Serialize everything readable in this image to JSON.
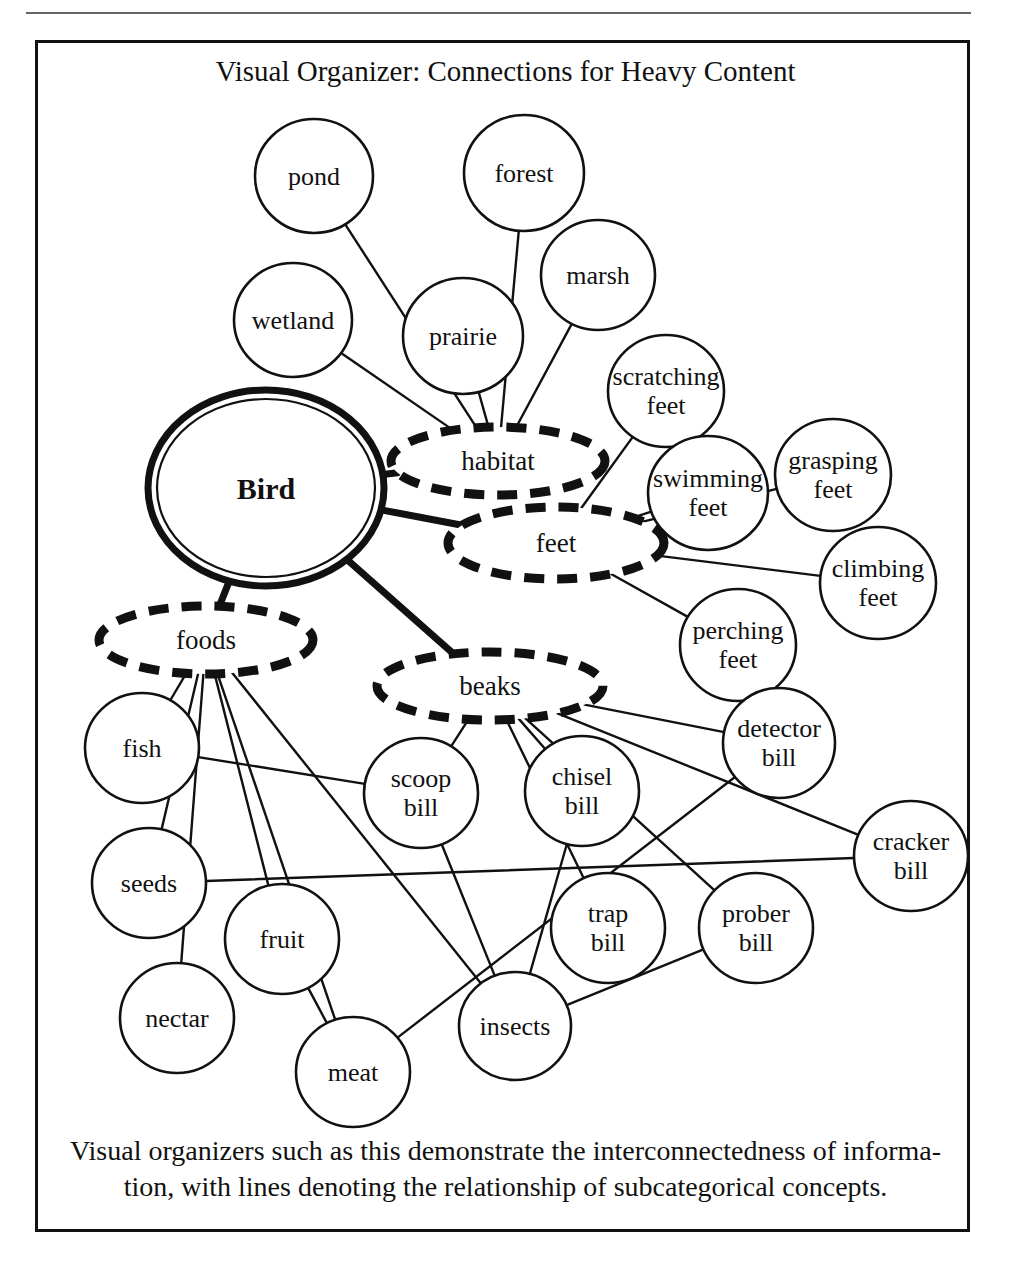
{
  "page": {
    "title": "Visual Organizer: Connections for Heavy Content",
    "caption_line1": "Visual organizers such as this demonstrate the interconnectedness of  informa-",
    "caption_line2": "tion, with lines denoting the relationship of subcategorical concepts.",
    "ghost_text": "",
    "colors": {
      "ink": "#111111",
      "page": "#ffffff",
      "rule": "#4a4a4a"
    }
  },
  "chart_data": {
    "type": "diagram",
    "title": "Visual Organizer: Connections for Heavy Content",
    "root": "Bird",
    "categories": [
      "habitat",
      "feet",
      "foods",
      "beaks"
    ],
    "nodes": [
      {
        "id": "bird",
        "label": "Bird",
        "kind": "root",
        "x": 228,
        "y": 445,
        "rx": 118,
        "ry": 98
      },
      {
        "id": "habitat",
        "label": "habitat",
        "kind": "category",
        "x": 460,
        "y": 418,
        "rx": 107,
        "ry": 34
      },
      {
        "id": "feet",
        "label": "feet",
        "kind": "category",
        "x": 518,
        "y": 500,
        "rx": 108,
        "ry": 36
      },
      {
        "id": "foods",
        "label": "foods",
        "kind": "category",
        "x": 168,
        "y": 597,
        "rx": 107,
        "ry": 34
      },
      {
        "id": "beaks",
        "label": "beaks",
        "kind": "category",
        "x": 452,
        "y": 643,
        "rx": 113,
        "ry": 34
      },
      {
        "id": "pond",
        "label": "pond",
        "kind": "leaf",
        "x": 276,
        "y": 133,
        "rx": 59,
        "ry": 57
      },
      {
        "id": "wetland",
        "label": "wetland",
        "kind": "leaf",
        "x": 255,
        "y": 277,
        "rx": 59,
        "ry": 57
      },
      {
        "id": "prairie",
        "label": "prairie",
        "kind": "leaf",
        "x": 425,
        "y": 293,
        "rx": 60,
        "ry": 58
      },
      {
        "id": "forest",
        "label": "forest",
        "kind": "leaf",
        "x": 486,
        "y": 130,
        "rx": 60,
        "ry": 58
      },
      {
        "id": "marsh",
        "label": "marsh",
        "kind": "leaf",
        "x": 560,
        "y": 232,
        "rx": 57,
        "ry": 55
      },
      {
        "id": "scratching-feet",
        "label": "scratching\nfeet",
        "kind": "leaf",
        "x": 628,
        "y": 348,
        "rx": 58,
        "ry": 56
      },
      {
        "id": "swimming-feet",
        "label": "swimming\nfeet",
        "kind": "leaf",
        "x": 670,
        "y": 450,
        "rx": 60,
        "ry": 57
      },
      {
        "id": "grasping-feet",
        "label": "grasping\nfeet",
        "kind": "leaf",
        "x": 795,
        "y": 432,
        "rx": 58,
        "ry": 56
      },
      {
        "id": "climbing-feet",
        "label": "climbing\nfeet",
        "kind": "leaf",
        "x": 840,
        "y": 540,
        "rx": 58,
        "ry": 56
      },
      {
        "id": "perching-feet",
        "label": "perching\nfeet",
        "kind": "leaf",
        "x": 700,
        "y": 602,
        "rx": 58,
        "ry": 56
      },
      {
        "id": "fish",
        "label": "fish",
        "kind": "leaf",
        "x": 104,
        "y": 705,
        "rx": 57,
        "ry": 55
      },
      {
        "id": "seeds",
        "label": "seeds",
        "kind": "leaf",
        "x": 111,
        "y": 840,
        "rx": 57,
        "ry": 55
      },
      {
        "id": "nectar",
        "label": "nectar",
        "kind": "leaf",
        "x": 139,
        "y": 975,
        "rx": 57,
        "ry": 55
      },
      {
        "id": "fruit",
        "label": "fruit",
        "kind": "leaf",
        "x": 244,
        "y": 896,
        "rx": 57,
        "ry": 55
      },
      {
        "id": "meat",
        "label": "meat",
        "kind": "leaf",
        "x": 315,
        "y": 1029,
        "rx": 57,
        "ry": 55
      },
      {
        "id": "insects",
        "label": "insects",
        "kind": "leaf",
        "x": 477,
        "y": 983,
        "rx": 56,
        "ry": 54
      },
      {
        "id": "scoop-bill",
        "label": "scoop\nbill",
        "kind": "leaf",
        "x": 383,
        "y": 750,
        "rx": 57,
        "ry": 55
      },
      {
        "id": "chisel-bill",
        "label": "chisel\nbill",
        "kind": "leaf",
        "x": 544,
        "y": 748,
        "rx": 57,
        "ry": 55
      },
      {
        "id": "detector-bill",
        "label": "detector\nbill",
        "kind": "leaf",
        "x": 741,
        "y": 700,
        "rx": 56,
        "ry": 55
      },
      {
        "id": "cracker-bill",
        "label": "cracker\nbill",
        "kind": "leaf",
        "x": 873,
        "y": 813,
        "rx": 57,
        "ry": 55
      },
      {
        "id": "trap-bill",
        "label": "trap\nbill",
        "kind": "leaf",
        "x": 570,
        "y": 885,
        "rx": 57,
        "ry": 55
      },
      {
        "id": "prober-bill",
        "label": "prober\nbill",
        "kind": "leaf",
        "x": 718,
        "y": 885,
        "rx": 57,
        "ry": 55
      }
    ],
    "edges": [
      {
        "from": "bird",
        "to": "habitat",
        "weight": "thick"
      },
      {
        "from": "bird",
        "to": "feet",
        "weight": "thick"
      },
      {
        "from": "bird",
        "to": "foods",
        "weight": "thick"
      },
      {
        "from": "bird",
        "to": "beaks",
        "weight": "thick"
      },
      {
        "from": "habitat",
        "to": "pond",
        "weight": "thin"
      },
      {
        "from": "habitat",
        "to": "wetland",
        "weight": "thin"
      },
      {
        "from": "habitat",
        "to": "prairie",
        "weight": "thin"
      },
      {
        "from": "habitat",
        "to": "forest",
        "weight": "thin"
      },
      {
        "from": "habitat",
        "to": "marsh",
        "weight": "thin"
      },
      {
        "from": "feet",
        "to": "scratching-feet",
        "weight": "thin"
      },
      {
        "from": "feet",
        "to": "swimming-feet",
        "weight": "thin"
      },
      {
        "from": "feet",
        "to": "grasping-feet",
        "weight": "thin"
      },
      {
        "from": "feet",
        "to": "climbing-feet",
        "weight": "thin"
      },
      {
        "from": "feet",
        "to": "perching-feet",
        "weight": "thin"
      },
      {
        "from": "foods",
        "to": "fish",
        "weight": "thin"
      },
      {
        "from": "foods",
        "to": "seeds",
        "weight": "thin"
      },
      {
        "from": "foods",
        "to": "nectar",
        "weight": "thin"
      },
      {
        "from": "foods",
        "to": "fruit",
        "weight": "thin"
      },
      {
        "from": "foods",
        "to": "meat",
        "weight": "thin"
      },
      {
        "from": "foods",
        "to": "insects",
        "weight": "thin"
      },
      {
        "from": "beaks",
        "to": "scoop-bill",
        "weight": "thin"
      },
      {
        "from": "beaks",
        "to": "chisel-bill",
        "weight": "thin"
      },
      {
        "from": "beaks",
        "to": "detector-bill",
        "weight": "thin"
      },
      {
        "from": "beaks",
        "to": "cracker-bill",
        "weight": "thin"
      },
      {
        "from": "beaks",
        "to": "trap-bill",
        "weight": "thin"
      },
      {
        "from": "beaks",
        "to": "prober-bill",
        "weight": "thin"
      },
      {
        "from": "fish",
        "to": "scoop-bill",
        "weight": "thin"
      },
      {
        "from": "seeds",
        "to": "cracker-bill",
        "weight": "thin"
      },
      {
        "from": "meat",
        "to": "detector-bill",
        "weight": "thin"
      },
      {
        "from": "insects",
        "to": "chisel-bill",
        "weight": "thin"
      },
      {
        "from": "insects",
        "to": "prober-bill",
        "weight": "thin"
      },
      {
        "from": "insects",
        "to": "scoop-bill",
        "weight": "thin"
      },
      {
        "from": "fruit",
        "to": "meat",
        "weight": "thin"
      }
    ],
    "legend": {
      "root_style": "double solid circle, bold label",
      "category_style": "dashed ellipse",
      "leaf_style": "thin solid circle"
    }
  }
}
